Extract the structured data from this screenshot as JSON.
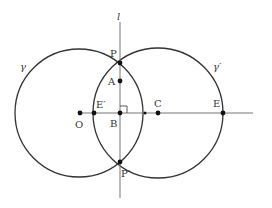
{
  "diagram": {
    "type": "geometry-construction",
    "colors": {
      "stroke": "#333333",
      "line": "#777777",
      "point": "#111111",
      "background": "#ffffff"
    },
    "line_l": {
      "label": "l",
      "x": 120,
      "y1": 22,
      "y2": 198
    },
    "axis": {
      "y": 113,
      "x1": 80,
      "x2": 253
    },
    "circles": [
      {
        "name": "gamma",
        "label": "γ",
        "cx": 79,
        "cy": 113,
        "r": 64,
        "label_x": 20,
        "label_y": 70
      },
      {
        "name": "gamma-prime",
        "label": "γ′",
        "cx": 158,
        "cy": 113,
        "r": 65,
        "label_x": 213,
        "label_y": 70
      }
    ],
    "points": [
      {
        "name": "P",
        "label": "P",
        "x": 120,
        "y": 63,
        "label_x": 110,
        "label_y": 57
      },
      {
        "name": "A",
        "label": "A",
        "x": 120,
        "y": 81,
        "label_x": 108,
        "label_y": 85
      },
      {
        "name": "B",
        "label": "B",
        "x": 120,
        "y": 113,
        "label_x": 110,
        "label_y": 127
      },
      {
        "name": "P-prime",
        "label": "P′",
        "x": 120,
        "y": 162,
        "label_x": 121,
        "label_y": 177
      },
      {
        "name": "O",
        "label": "O",
        "x": 80,
        "y": 113,
        "label_x": 75,
        "label_y": 128
      },
      {
        "name": "E-prime",
        "label": "E′",
        "x": 94,
        "y": 113,
        "label_x": 96,
        "label_y": 108
      },
      {
        "name": "C",
        "label": "C",
        "x": 158,
        "y": 113,
        "label_x": 154,
        "label_y": 107
      },
      {
        "name": "E",
        "label": "E",
        "x": 223,
        "y": 113,
        "label_x": 213,
        "label_y": 107
      },
      {
        "name": "axis-intersect",
        "label": "",
        "x": 145,
        "y": 113
      }
    ],
    "right_angle_marker": {
      "x": 120,
      "y": 113,
      "size": 7
    }
  }
}
